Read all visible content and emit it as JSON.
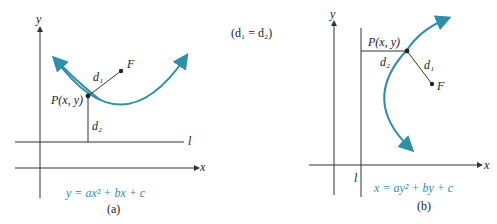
{
  "colors": {
    "curve": "#2e8fa6",
    "axis": "#333333",
    "equation": "#2e8fa6"
  },
  "center_label": "(d₁ = d₂)",
  "diagram_a": {
    "caption": "(a)",
    "equation": "y = ax² + bx + c",
    "axis_x": "x",
    "axis_y": "y",
    "directrix": "l",
    "point": "P(x, y)",
    "focus": "F",
    "d1": "d₁",
    "d2": "d₂"
  },
  "diagram_b": {
    "caption": "(b)",
    "equation": "x = ay² + by + c",
    "axis_x": "x",
    "axis_y": "y",
    "directrix": "l",
    "point": "P(x, y)",
    "focus": "F",
    "d1": "d₁",
    "d2": "d₂"
  }
}
